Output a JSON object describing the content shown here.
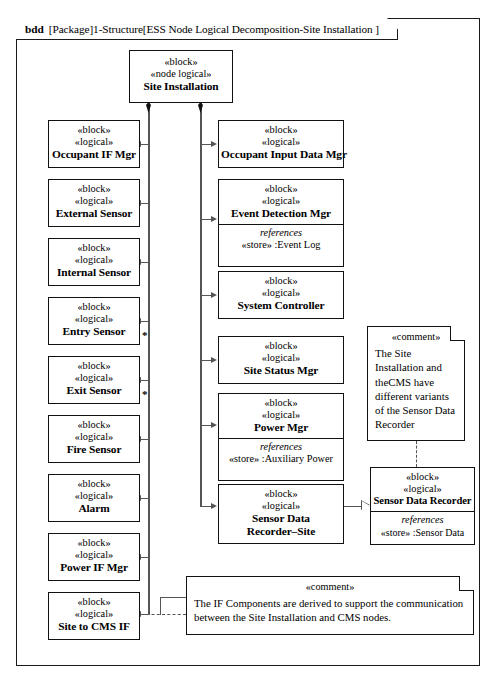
{
  "diagram": {
    "kind": "bdd",
    "title": "[Package]1-Structure[ESS Node Logical Decomposition-Site Installation ]"
  },
  "root_block": {
    "stereotype1": "«leblock»",
    "stereotype_block": "«block»",
    "stereotype_node": "«node logical»",
    "name": "Site Installation"
  },
  "labels": {
    "stereotype_block": "«block»",
    "stereotype_logical": "«logical»",
    "references": "references",
    "comment": "«comment»",
    "multiplicity_star": "*"
  },
  "left_column": [
    {
      "stereo1": "«block»",
      "stereo2": "«logical»",
      "name": "Occupant IF Mgr",
      "multiplicity": ""
    },
    {
      "stereo1": "«block»",
      "stereo2": "«logical»",
      "name": "External Sensor",
      "multiplicity": ""
    },
    {
      "stereo1": "«block»",
      "stereo2": "«logical»",
      "name": "Internal Sensor",
      "multiplicity": ""
    },
    {
      "stereo1": "«block»",
      "stereo2": "«logical»",
      "name": "Entry Sensor",
      "multiplicity": "*"
    },
    {
      "stereo1": "«block»",
      "stereo2": "«logical»",
      "name": "Exit Sensor",
      "multiplicity": "*"
    },
    {
      "stereo1": "«block»",
      "stereo2": "«logical»",
      "name": "Fire Sensor",
      "multiplicity": ""
    },
    {
      "stereo1": "«block»",
      "stereo2": "«logical»",
      "name": "Alarm",
      "multiplicity": ""
    },
    {
      "stereo1": "«block»",
      "stereo2": "«logical»",
      "name": "Power IF Mgr",
      "multiplicity": ""
    },
    {
      "stereo1": "«block»",
      "stereo2": "«logical»",
      "name": "Site to CMS IF",
      "multiplicity": ""
    }
  ],
  "middle_column": [
    {
      "stereo1": "«block»",
      "stereo2": "«logical»",
      "name": "Occupant Input Data Mgr",
      "refs_title": "",
      "refs_value": ""
    },
    {
      "stereo1": "«block»",
      "stereo2": "«logical»",
      "name": "Event Detection Mgr",
      "refs_title": "references",
      "refs_value": "«store»  :Event Log"
    },
    {
      "stereo1": "«block»",
      "stereo2": "«logical»",
      "name": "System Controller",
      "refs_title": "",
      "refs_value": ""
    },
    {
      "stereo1": "«block»",
      "stereo2": "«logical»",
      "name": "Site Status Mgr",
      "refs_title": "",
      "refs_value": ""
    },
    {
      "stereo1": "«block»",
      "stereo2": "«logical»",
      "name": "Power Mgr",
      "refs_title": "references",
      "refs_value": "«store»  :Auxiliary Power"
    },
    {
      "stereo1": "«block»",
      "stereo2": "«logical»",
      "name_line1": "Sensor Data",
      "name_line2": "Recorder–Site",
      "refs_title": "",
      "refs_value": ""
    }
  ],
  "right_column": {
    "sensor_data_recorder": {
      "stereo1": "«block»",
      "stereo2": "«logical»",
      "name": "Sensor Data Recorder",
      "refs_title": "references",
      "refs_value": "«store»  :Sensor Data"
    }
  },
  "notes": {
    "recorder_note": {
      "title": "«comment»",
      "text": "The Site Installation and theCMS have different variants of the Sensor Data Recorder"
    },
    "if_note": {
      "title": "«comment»",
      "text": "The IF Components are derived to support the communication between the Site Installation and CMS nodes."
    }
  }
}
